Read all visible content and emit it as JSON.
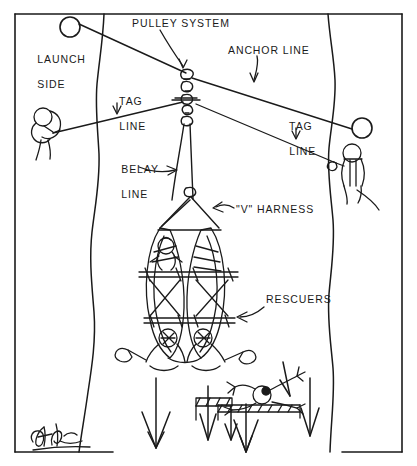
{
  "diagram": {
    "ink_color": "#1a1a1a",
    "paper_color": "#ffffff",
    "labels": {
      "pulley_system": "PULLEY SYSTEM",
      "launch_side_line1": "LAUNCH",
      "launch_side_line2": "SIDE",
      "anchor_line": "ANCHOR LINE",
      "tag_line_left_line1": "TAG",
      "tag_line_left_line2": "LINE",
      "tag_line_right_line1": "TAG",
      "tag_line_right_line2": "LINE",
      "belay_line_line1": "BELAY",
      "belay_line_line2": "LINE",
      "v_harness": "\"V\" HARNESS",
      "rescuers": "RESCUERS"
    },
    "elements": {
      "left_anchor": "tree-anchor-circle",
      "right_anchor": "tree-anchor-circle",
      "left_bank": "river-bank-edge",
      "right_bank": "river-bank-edge",
      "left_tender": "rope-tender-figure",
      "right_tender": "rope-tender-figure",
      "craft": "double-kayak-litter",
      "victim": "victim-on-strainer",
      "current": "downstream-flow-arrows",
      "signature": "artist-signature"
    }
  }
}
